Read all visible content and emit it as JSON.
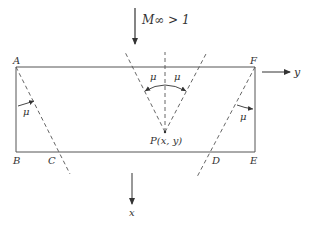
{
  "diagram": {
    "freestream_label": "M∞ > 1",
    "axes": {
      "x_label": "x",
      "y_label": "y"
    },
    "corners": {
      "A": "A",
      "B": "B",
      "C": "C",
      "D": "D",
      "E": "E",
      "F": "F"
    },
    "point_label": "P(x, y)",
    "angle_labels": {
      "left": "μ",
      "center_left": "μ",
      "center_right": "μ",
      "right": "μ"
    },
    "colors": {
      "line": "#555555",
      "text": "#333333",
      "background": "#ffffff"
    }
  }
}
